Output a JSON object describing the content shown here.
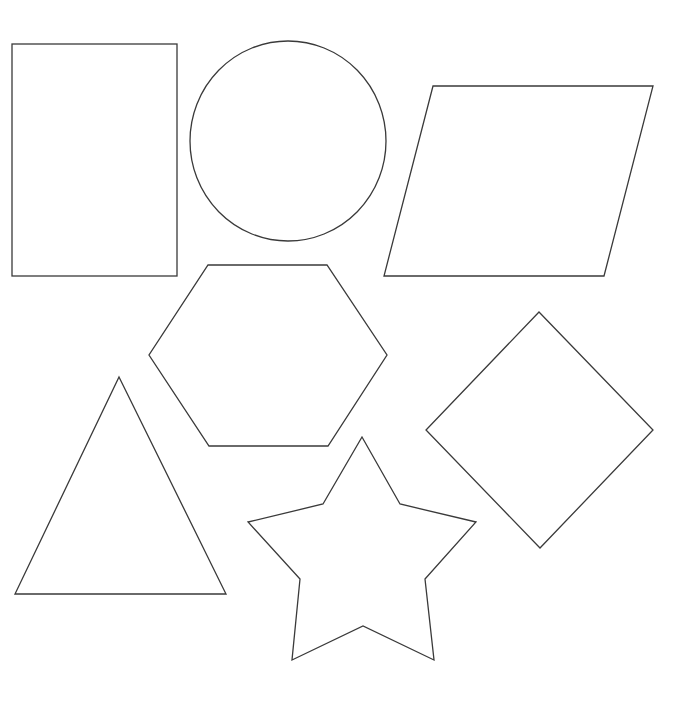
{
  "diagram": {
    "background": "#ffffff",
    "stroke_color": "#3a3a3a",
    "shapes": [
      {
        "name": "rectangle",
        "type": "rect",
        "x": 12,
        "y": 44,
        "width": 165,
        "height": 232
      },
      {
        "name": "circle",
        "type": "ellipse",
        "cx": 288,
        "cy": 141,
        "rx": 98,
        "ry": 100
      },
      {
        "name": "parallelogram",
        "type": "polygon",
        "points": "433,86 653,86 604,276 384,276"
      },
      {
        "name": "hexagon",
        "type": "polygon",
        "points": "208,265 327,265 387,355 328,446 209,446 149,355"
      },
      {
        "name": "diamond",
        "type": "polygon",
        "points": "539,312 653,430 540,548 426,430"
      },
      {
        "name": "triangle",
        "type": "polygon",
        "points": "119,377 226,594 15,594"
      },
      {
        "name": "star",
        "type": "polygon",
        "points": "362,437 400,504 476,522 425,579 434,660 363,626 292,660 300,579 248,522 323,504"
      }
    ]
  }
}
